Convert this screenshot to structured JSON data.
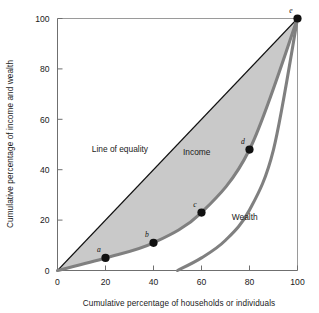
{
  "chart_data": {
    "type": "line",
    "title": "",
    "xlabel": "Cumulative percentage of households or individuals",
    "ylabel": "Cumulative percentage of income and wealth",
    "xlim": [
      0,
      100
    ],
    "ylim": [
      0,
      100
    ],
    "xticks": [
      "0",
      "20",
      "40",
      "60",
      "80",
      "100"
    ],
    "yticks": [
      "0",
      "20",
      "40",
      "60",
      "80",
      "100"
    ],
    "xtick_values": [
      0,
      20,
      40,
      60,
      80,
      100
    ],
    "ytick_values": [
      0,
      20,
      40,
      60,
      80,
      100
    ],
    "grid": false,
    "legend": "inline-annotations",
    "shaded_region": {
      "label": "area between line of equality and income curve",
      "color": "#c9c9c9"
    },
    "series": [
      {
        "name": "Line of equality",
        "style": "straight-thin-black",
        "color": "#111111",
        "x": [
          0,
          100
        ],
        "values": [
          0,
          100
        ]
      },
      {
        "name": "Income",
        "style": "thick-gray-curve",
        "color": "#808080",
        "x": [
          0,
          20,
          40,
          60,
          80,
          100
        ],
        "values": [
          0,
          5,
          11,
          23,
          48,
          100
        ]
      },
      {
        "name": "Wealth",
        "style": "thick-gray-curve",
        "color": "#808080",
        "x": [
          50,
          60,
          70,
          80,
          90,
          100
        ],
        "values": [
          0,
          5,
          12,
          24,
          48,
          100
        ]
      }
    ],
    "points": [
      {
        "label": "a",
        "x": 20,
        "y": 5
      },
      {
        "label": "b",
        "x": 40,
        "y": 11
      },
      {
        "label": "c",
        "x": 60,
        "y": 23
      },
      {
        "label": "d",
        "x": 80,
        "y": 48
      },
      {
        "label": "e",
        "x": 100,
        "y": 100
      }
    ],
    "annotations": [
      {
        "text": "Line of equality",
        "x": 26,
        "y": 47
      },
      {
        "text": "Income",
        "x": 58,
        "y": 46
      },
      {
        "text": "Wealth",
        "x": 78,
        "y": 20
      }
    ]
  },
  "colors": {
    "plot_background": "#ffffff",
    "shade": "#c9c9c9",
    "curve": "#808080",
    "equality_line": "#111111",
    "axis": "#6f6f6f",
    "point": "#111111",
    "text": "#1a1a1a"
  }
}
